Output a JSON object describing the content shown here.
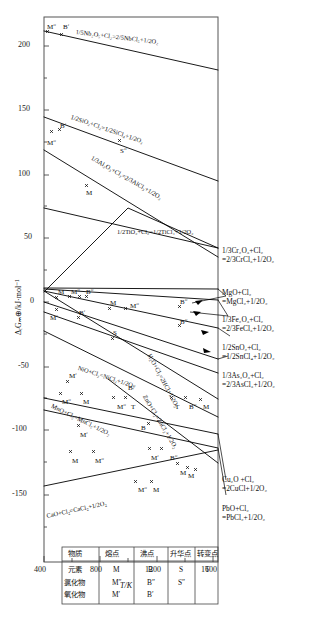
{
  "figure": {
    "axes": {
      "x": {
        "label": "T/K",
        "ticks": [
          400,
          800,
          1200,
          1600
        ],
        "minor_ticks": [
          600,
          1000,
          1400
        ],
        "range": [
          400,
          1600
        ]
      },
      "y": {
        "label": "ΔᵣGₘ⊕/kJ·mol⁻¹",
        "ticks": [
          200,
          150,
          100,
          50,
          0,
          -50,
          -100,
          -150
        ],
        "range": [
          -160,
          225
        ]
      }
    },
    "legend_table": {
      "headers": [
        "物质",
        "熔点",
        "沸点",
        "升华点",
        "转变点"
      ],
      "rows": [
        {
          "substance": "元素",
          "melting": "M",
          "boiling": "B",
          "sublimation": "S",
          "transition": "T"
        },
        {
          "substance": "氯化物",
          "melting": "Mʺ",
          "boiling": "Bʺ",
          "sublimation": "Sʺ",
          "transition": ""
        },
        {
          "substance": "氧化物",
          "melting": "Mʹ",
          "boiling": "Bʹ",
          "sublimation": "",
          "transition": ""
        }
      ]
    },
    "inline_equations": [
      {
        "id": "nb",
        "text": "1/5Nb₂O₅+Cl₂=2/5NbCl₅+1/2O₂"
      },
      {
        "id": "si",
        "text": "1/2SiO₂+Cl₂=1/2SiCl₄+1/2O₂"
      },
      {
        "id": "al",
        "text": "1/3Al₂O₃+Cl₂=2/3AlCl₃+1/2O₂"
      },
      {
        "id": "ti",
        "text": "1/2TiO₂+Cl₂=1/2TiCl₄+1/2O₂"
      },
      {
        "id": "ni",
        "text": "NiO+Cl₂=NiCl₂+1/2O₂"
      },
      {
        "id": "h2o",
        "text": "H₂O+Cl₂=2HCl+1/2O₂"
      },
      {
        "id": "mn",
        "text": "MnO+Cl₂=MnCl₂+1/2O₂"
      },
      {
        "id": "zn",
        "text": "ZnO+Cl₂=ZnCl₂+1/2O₂"
      },
      {
        "id": "ca",
        "text": "CaO+Cl₂=CaCl₂+1/2O₂"
      }
    ],
    "right_labels": [
      {
        "id": "cr",
        "line1": "1/3Cr₂O₃+Cl₂",
        "line2": "=2/3CrCl₃+1/2O₂"
      },
      {
        "id": "mg",
        "line1": "MgO+Cl₂",
        "line2": "=MgCl₂+1/2O₂"
      },
      {
        "id": "fe",
        "line1": "1/3Fe₂O₃+Cl₂",
        "line2": "=2/3FeCl₃+1/2O₂"
      },
      {
        "id": "sn",
        "line1": "1/2SnO₂+Cl₂",
        "line2": "=1/2SnCl₄+1/2O₂"
      },
      {
        "id": "as",
        "line1": "1/3As₂O₃+Cl₂",
        "line2": "=2/3AsCl₃+1/2O₂"
      },
      {
        "id": "cu",
        "line1": "Cu₂O +Cl₂",
        "line2": "=2CuCl+1/2O₂"
      },
      {
        "id": "pb",
        "line1": "PbO+Cl₂",
        "line2": "=PbCl₂+1/2O₂"
      }
    ],
    "point_markers": [
      {
        "t": "Mʺ",
        "x": 47,
        "y": 24
      },
      {
        "t": "Bʹ",
        "x": 63,
        "y": 24
      },
      {
        "t": "Bʹ",
        "x": 60,
        "y": 123
      },
      {
        "t": "Mʺ",
        "x": 47,
        "y": 140
      },
      {
        "t": "M",
        "x": 86,
        "y": 190
      },
      {
        "t": "Sʺ",
        "x": 120,
        "y": 148
      },
      {
        "t": "M",
        "x": 58,
        "y": 289
      },
      {
        "t": "Mʺ",
        "x": 71,
        "y": 289
      },
      {
        "t": "Bʺ",
        "x": 86,
        "y": 289
      },
      {
        "t": "Mʹ",
        "x": 50,
        "y": 315
      },
      {
        "t": "Bʹ",
        "x": 79,
        "y": 310
      },
      {
        "t": "M",
        "x": 110,
        "y": 300
      },
      {
        "t": "Mʺ",
        "x": 130,
        "y": 303
      },
      {
        "t": "Bʺ",
        "x": 180,
        "y": 299
      },
      {
        "t": "Bʺ",
        "x": 180,
        "y": 319
      },
      {
        "t": "S",
        "x": 113,
        "y": 330
      },
      {
        "t": "Mʹ",
        "x": 69,
        "y": 373
      },
      {
        "t": "Mʺ",
        "x": 62,
        "y": 399
      },
      {
        "t": "M",
        "x": 83,
        "y": 399
      },
      {
        "t": "Bʺ",
        "x": 128,
        "y": 385
      },
      {
        "t": "Mʺ",
        "x": 117,
        "y": 404
      },
      {
        "t": "T",
        "x": 131,
        "y": 404
      },
      {
        "t": "T",
        "x": 175,
        "y": 404
      },
      {
        "t": "Bʺ",
        "x": 189,
        "y": 404
      },
      {
        "t": "M",
        "x": 203,
        "y": 404
      },
      {
        "t": "B",
        "x": 141,
        "y": 425
      },
      {
        "t": "Mʹ",
        "x": 80,
        "y": 432
      },
      {
        "t": "M",
        "x": 72,
        "y": 458
      },
      {
        "t": "Mʺ",
        "x": 95,
        "y": 458
      },
      {
        "t": "Mʹ",
        "x": 151,
        "y": 455
      },
      {
        "t": "Bʺ",
        "x": 170,
        "y": 455
      },
      {
        "t": "M",
        "x": 180,
        "y": 470
      },
      {
        "t": "M",
        "x": 188,
        "y": 473
      },
      {
        "t": "Mʺ",
        "x": 138,
        "y": 487
      },
      {
        "t": "M",
        "x": 153,
        "y": 487
      }
    ],
    "caption": ""
  },
  "chart_data": {
    "type": "line",
    "title": "",
    "xlabel": "T/K",
    "ylabel": "ΔᵣGₘ⊕/kJ·mol⁻¹",
    "xlim": [
      400,
      1600
    ],
    "ylim": [
      -160,
      225
    ],
    "grid": false,
    "legend": "inline-labels",
    "series": [
      {
        "name": "1/5Nb₂O₅+Cl₂=2/5NbCl₅+1/2O₂",
        "x": [
          400,
          1600
        ],
        "y": [
          212,
          182
        ]
      },
      {
        "name": "1/2SiO₂+Cl₂=1/2SiCl₄+1/2O₂",
        "x": [
          400,
          1600
        ],
        "y": [
          144,
          94
        ]
      },
      {
        "name": "1/3Al₂O₃+Cl₂=2/3AlCl₃+1/2O₂",
        "x": [
          400,
          1600
        ],
        "y": [
          118,
          35
        ]
      },
      {
        "name": "1/3Cr₂O₃+Cl₂=2/3CrCl₃+1/2O₂",
        "x": [
          400,
          1600
        ],
        "y": [
          73,
          42
        ]
      },
      {
        "name": "1/2TiO₂+Cl₂=1/2TiCl₄+1/2O₂",
        "x": [
          400,
          1000,
          1600
        ],
        "y": [
          24,
          73,
          42
        ]
      },
      {
        "name": "MgO+Cl₂=MgCl₂+1/2O₂",
        "x": [
          400,
          1600
        ],
        "y": [
          27,
          10
        ]
      },
      {
        "name": "1/3Fe₂O₃+Cl₂=2/3FeCl₃+1/2O₂",
        "x": [
          400,
          1600
        ],
        "y": [
          26,
          2
        ]
      },
      {
        "name": "1/2SnO₂+Cl₂=1/2SnCl₄+1/2O₂",
        "x": [
          400,
          1600
        ],
        "y": [
          24,
          -20
        ]
      },
      {
        "name": "1/3As₂O₃+Cl₂=2/3AsCl₃+1/2O₂",
        "x": [
          400,
          1600
        ],
        "y": [
          15,
          -44
        ]
      },
      {
        "name": "NiO+Cl₂=NiCl₂+1/2O₂",
        "x": [
          400,
          1600
        ],
        "y": [
          -8,
          -55
        ]
      },
      {
        "name": "H₂O+Cl₂=2HCl+1/2O₂",
        "x": [
          400,
          1600
        ],
        "y": [
          25,
          -75
        ]
      },
      {
        "name": "MnO+Cl₂=MnCl₂+1/2O₂",
        "x": [
          400,
          1600
        ],
        "y": [
          -23,
          -90
        ]
      },
      {
        "name": "ZnO+Cl₂=ZnCl₂+1/2O₂",
        "x": [
          800,
          1600
        ],
        "y": [
          -44,
          -110
        ]
      },
      {
        "name": "Cu₂O +Cl₂=2CuCl+1/2O₂",
        "x": [
          400,
          1600
        ],
        "y": [
          -75,
          -103
        ]
      },
      {
        "name": "PbO+Cl₂=PbCl₂+1/2O₂",
        "x": [
          400,
          1600
        ],
        "y": [
          -85,
          -113
        ]
      },
      {
        "name": "CaO+Cl₂=CaCl₂+1/2O₂",
        "x": [
          400,
          1600
        ],
        "y": [
          -143,
          -113
        ]
      }
    ]
  }
}
